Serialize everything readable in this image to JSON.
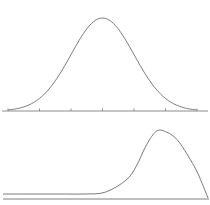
{
  "chart_data": [
    {
      "type": "line",
      "title": "",
      "subtitle": "Normal distribution (symmetric bell curve)",
      "xlabel": "",
      "ylabel": "",
      "x_ticks": [
        -3,
        -2,
        -1,
        0,
        1,
        2,
        3
      ],
      "tick_labels": [],
      "xlim": [
        -3.1,
        3.3
      ],
      "ylim": [
        0,
        0.42
      ],
      "grid": false,
      "legend": null,
      "series": [
        {
          "name": "normal",
          "x": [
            -3,
            -2.5,
            -2,
            -1.5,
            -1,
            -0.5,
            0,
            0.5,
            1,
            1.5,
            2,
            2.5,
            3
          ],
          "values": [
            0.004,
            0.018,
            0.054,
            0.13,
            0.242,
            0.352,
            0.399,
            0.352,
            0.242,
            0.13,
            0.054,
            0.018,
            0.004
          ]
        }
      ]
    },
    {
      "type": "line",
      "title": "",
      "subtitle": "Skewed distribution (left-skewed, mode on right)",
      "xlabel": "",
      "ylabel": "",
      "x_ticks": [],
      "xlim": [
        0,
        1
      ],
      "ylim": [
        0,
        1
      ],
      "grid": false,
      "legend": null,
      "series": [
        {
          "name": "skewed",
          "x": [
            0.0,
            0.1,
            0.2,
            0.3,
            0.4,
            0.5,
            0.6,
            0.65,
            0.7,
            0.75,
            0.8,
            0.85,
            0.9,
            0.95,
            1.0
          ],
          "values": [
            0.0,
            0.0,
            0.0,
            0.0,
            0.0,
            0.03,
            0.22,
            0.44,
            0.78,
            1.0,
            0.98,
            0.86,
            0.62,
            0.33,
            0.0
          ]
        }
      ]
    }
  ],
  "labels": {
    "top_chart": "Normal distribution",
    "bottom_chart": "Skewed distribution"
  }
}
